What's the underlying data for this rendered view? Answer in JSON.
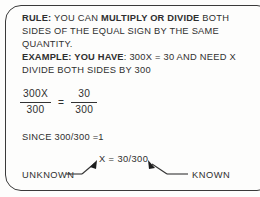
{
  "document": {
    "type": "instructional-rule-box",
    "border_color": "#3a3a3a",
    "text_color": "#2f2f2f",
    "background": "#fdfdfc"
  },
  "rule": {
    "heading": "RULE:",
    "text_before": " YOU CAN ",
    "emphasis": "MULTIPLY OR DIVIDE",
    "text_after": " BOTH SIDES OF THE EQUAL SIGN BY THE SAME QUANTITY."
  },
  "example": {
    "heading": "EXAMPLE:",
    "lead": " YOU HAVE",
    "statement": ": 300X = 30 AND NEED X",
    "instruction": "DIVIDE BOTH SIDES BY 300"
  },
  "equation": {
    "left_numerator": "300X",
    "left_denominator": "300",
    "operator": "=",
    "right_numerator": "30",
    "right_denominator": "300"
  },
  "since_line": "SINCE 300/300 =1",
  "answer": {
    "text": "X = 30/300"
  },
  "annotations": {
    "unknown_label": "UNKNOWN",
    "known_label": "KNOWN",
    "unknown_points_to": "X",
    "known_points_to": "30/300"
  }
}
